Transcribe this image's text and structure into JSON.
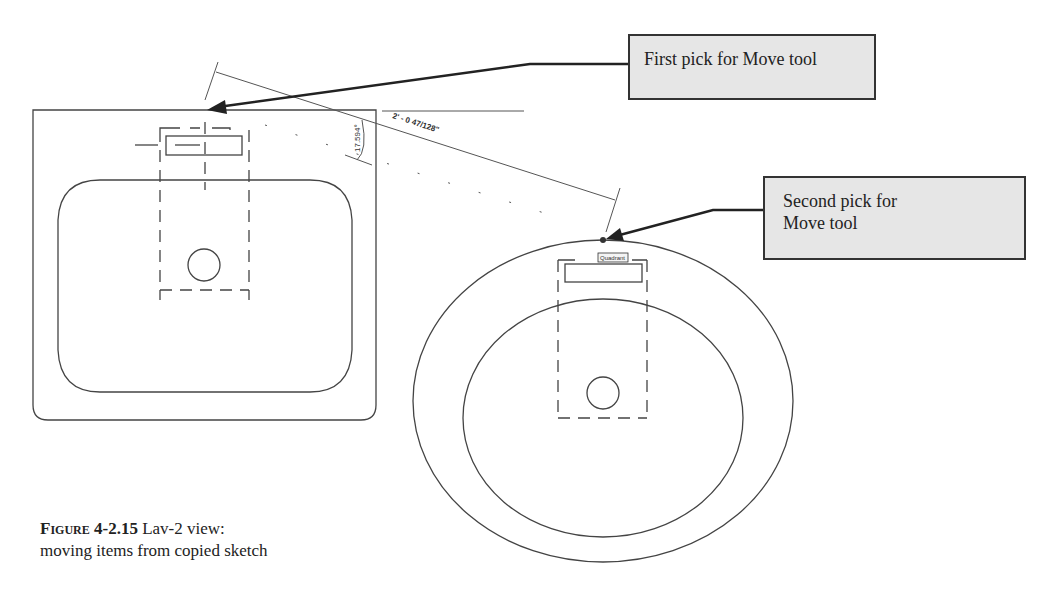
{
  "callouts": {
    "first_pick": "First pick for Move tool",
    "second_pick_line1": "Second pick for",
    "second_pick_line2": "Move tool"
  },
  "dimensions": {
    "aligned_length": "2' - 0 47/128\"",
    "angle": "17.594°"
  },
  "snap_tooltip": "Quadrant",
  "caption": {
    "figure_label": "Figure 4-2.15",
    "line1_text": " Lav-2 view:",
    "line2_text": "moving items from copied sketch"
  },
  "colors": {
    "line": "#333333",
    "callout_fill": "#e6e6e6",
    "background": "#ffffff"
  }
}
